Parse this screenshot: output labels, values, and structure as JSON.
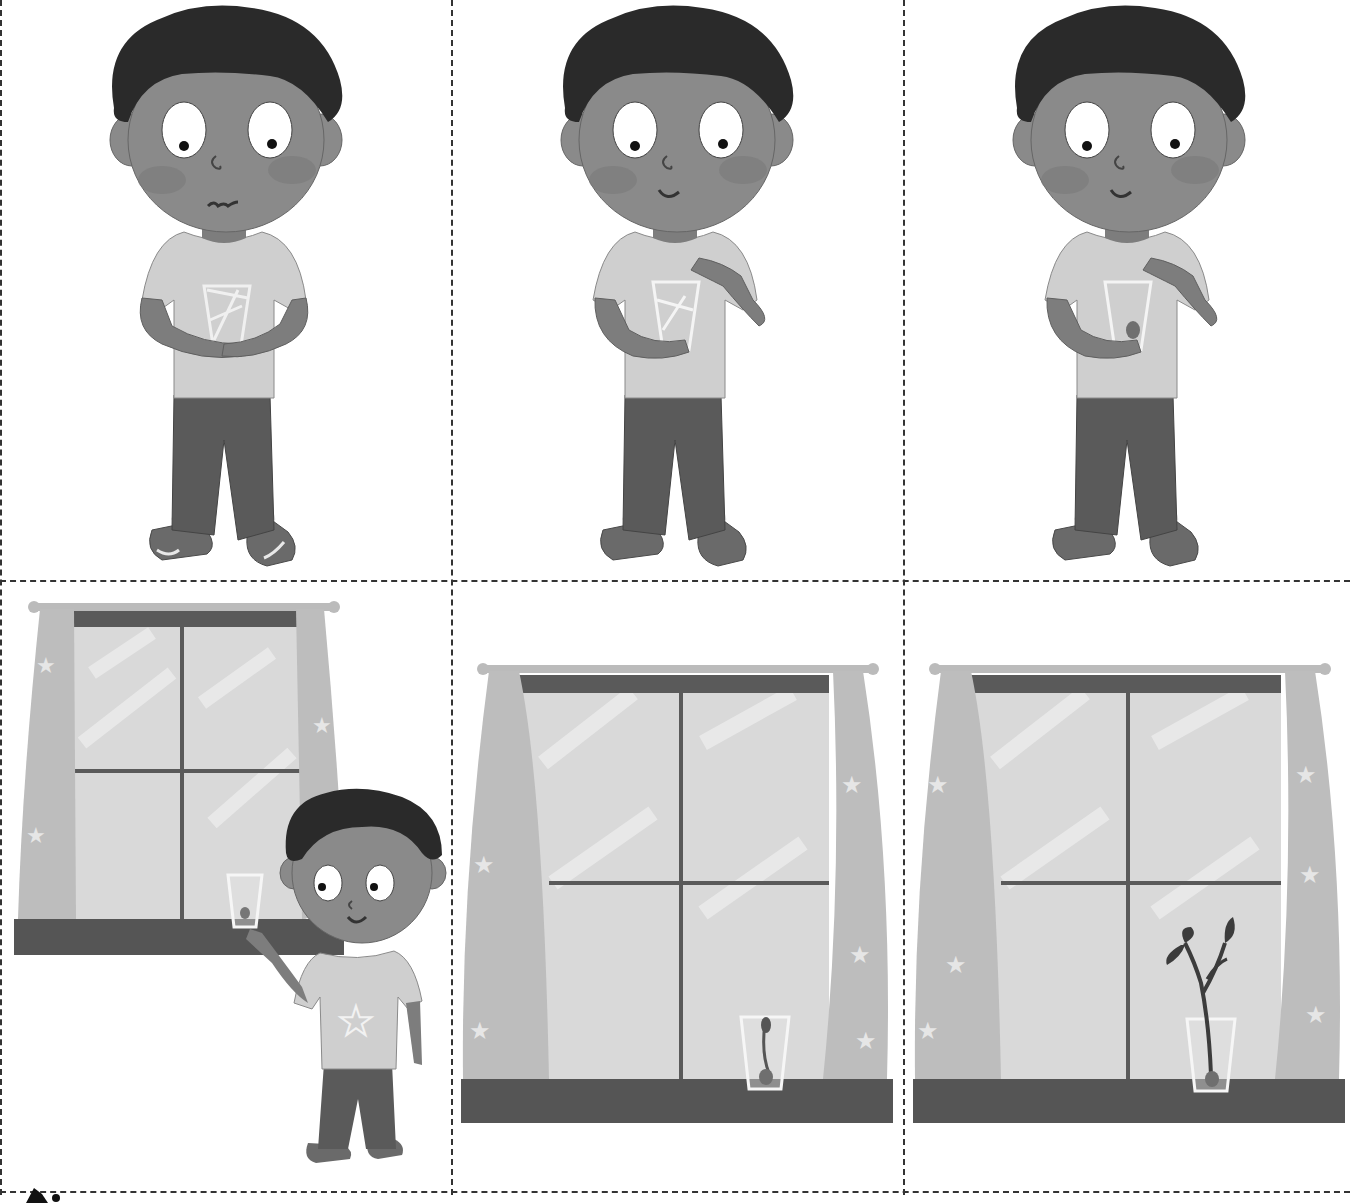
{
  "worksheet": {
    "type": "sequencing-cut-out-cards",
    "layout": {
      "rows": 2,
      "columns": 3
    },
    "cut_line_style": "dashed",
    "colors": {
      "background": "#ffffff",
      "cut_line": "#333333",
      "skin": "#8a8a8a",
      "skin_dark": "#6f6f6f",
      "hair": "#2a2a2a",
      "shirt": "#cfcfcf",
      "trousers": "#5a5a5a",
      "shoes": "#6a6a6a",
      "window_glass": "#d9d9d9",
      "window_frame": "#5a5a5a",
      "curtain": "#bdbdbd",
      "sill": "#555555",
      "plant": "#3c3c3c"
    },
    "cards": [
      {
        "position": 1,
        "row": 1,
        "col": 1,
        "scene": "boy-holding-empty-glass",
        "expression": "wavy-mouth"
      },
      {
        "position": 2,
        "row": 1,
        "col": 2,
        "scene": "boy-dropping-seed-into-glass",
        "expression": "smile"
      },
      {
        "position": 3,
        "row": 1,
        "col": 3,
        "scene": "boy-holding-glass-with-seed",
        "expression": "smile"
      },
      {
        "position": 4,
        "row": 2,
        "col": 1,
        "scene": "boy-placing-glass-on-windowsill",
        "expression": "smile"
      },
      {
        "position": 5,
        "row": 2,
        "col": 2,
        "scene": "seed-sprouting-in-glass-on-windowsill"
      },
      {
        "position": 6,
        "row": 2,
        "col": 3,
        "scene": "plant-growing-in-glass-on-windowsill"
      }
    ],
    "icons": [
      "scissors-icon"
    ]
  }
}
